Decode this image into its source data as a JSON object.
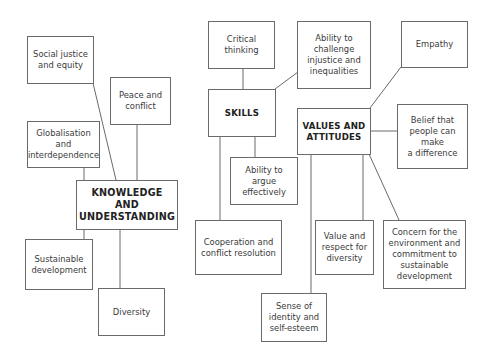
{
  "diagram": {
    "hubs": {
      "knowledge": "KNOWLEDGE AND\nUNDERSTANDING",
      "skills": "SKILLS",
      "values": "VALUES AND\nATTITUDES"
    },
    "knowledge_nodes": {
      "social_justice": "Social justice\nand equity",
      "peace": "Peace and\nconflict",
      "globalisation": "Globalisation and\ninterdependence",
      "sustainable": "Sustainable\ndevelopment",
      "diversity": "Diversity"
    },
    "skills_nodes": {
      "critical": "Critical\nthinking",
      "challenge": "Ability to\nchallenge\ninjustice and\ninequalities",
      "argue": "Ability to argue\neffectively",
      "cooperation": "Cooperation and\nconflict resolution"
    },
    "values_nodes": {
      "empathy": "Empathy",
      "belief": "Belief that\npeople can make\na difference",
      "value_respect": "Value and\nrespect for\ndiversity",
      "concern": "Concern for the\nenvironment and\ncommitment to\nsustainable\ndevelopment",
      "identity": "Sense of\nidentity and\nself-esteem"
    },
    "colors": {
      "line": "#6a6a6a",
      "text": "#333333",
      "background": "#ffffff"
    }
  }
}
